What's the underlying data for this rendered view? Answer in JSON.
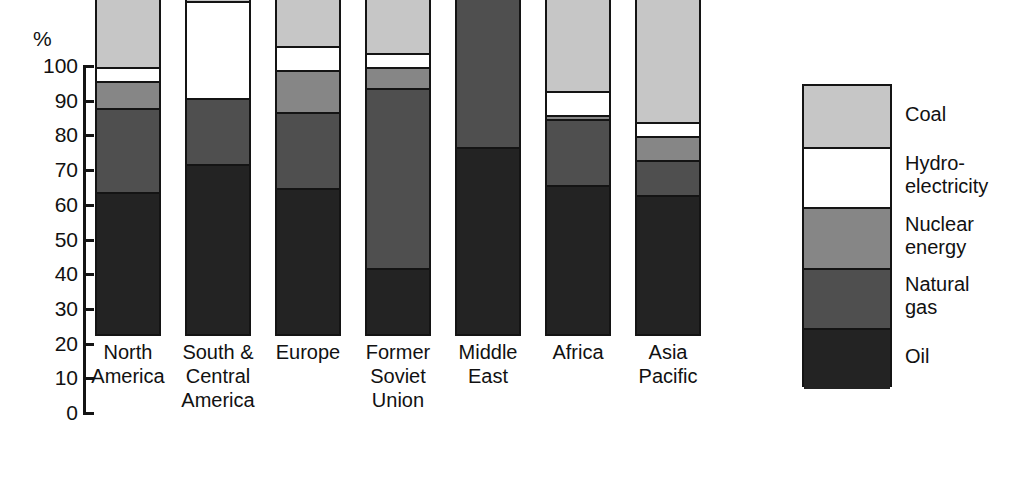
{
  "chart_data": {
    "type": "bar",
    "title": "",
    "subtitle": "",
    "xlabel": "",
    "ylabel": "%",
    "ylim": [
      0,
      100
    ],
    "yticks": [
      0,
      10,
      20,
      30,
      40,
      50,
      60,
      70,
      80,
      90,
      100
    ],
    "ytick_labels": [
      "0",
      "10",
      "20",
      "30",
      "40",
      "50",
      "60",
      "70",
      "80",
      "90",
      "100"
    ],
    "grid": false,
    "stacked": true,
    "stack_order_bottom_to_top": [
      "Oil",
      "Natural gas",
      "Nuclear energy",
      "Hydro-electricity",
      "Coal"
    ],
    "legend_position": "right",
    "categories": [
      "North\nAmerica",
      "South &\nCentral\nAmerica",
      "Europe",
      "Former\nSoviet\nUnion",
      "Middle\nEast",
      "Africa",
      "Asia\nPacific"
    ],
    "series": [
      {
        "name": "Oil",
        "color": "#232323",
        "values": [
          41,
          49,
          42,
          19,
          54,
          43,
          40
        ]
      },
      {
        "name": "Natural gas",
        "color": "#4f4f4f",
        "values": [
          24,
          19,
          22,
          52,
          45,
          19,
          10
        ]
      },
      {
        "name": "Nuclear energy",
        "color": "#868686",
        "values": [
          8,
          0,
          12,
          6,
          0,
          1,
          7
        ]
      },
      {
        "name": "Hydro-electricity",
        "color": "#ffffff",
        "values": [
          4,
          28,
          7,
          4,
          0,
          7,
          4
        ]
      },
      {
        "name": "Coal",
        "color": "#c6c6c6",
        "values": [
          23,
          4,
          17,
          19,
          1,
          30,
          39
        ]
      }
    ],
    "legend_entries": [
      {
        "label": "Coal",
        "color": "#c6c6c6"
      },
      {
        "label": "Hydro-\nelectricity",
        "color": "#ffffff"
      },
      {
        "label": "Nuclear\nenergy",
        "color": "#868686"
      },
      {
        "label": "Natural\ngas",
        "color": "#4f4f4f"
      },
      {
        "label": "Oil",
        "color": "#232323"
      }
    ]
  },
  "axis": {
    "unit_label": "%"
  },
  "colors": {
    "coal": "#c6c6c6",
    "hydro": "#ffffff",
    "nuclear": "#868686",
    "natural_gas": "#4f4f4f",
    "oil": "#232323",
    "outline": "#141414",
    "background": "#ffffff"
  }
}
